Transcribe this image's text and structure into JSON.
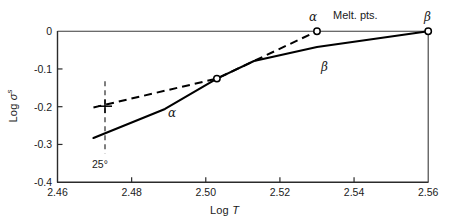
{
  "chart_data": {
    "type": "line",
    "title": "",
    "xlabel": "Log T",
    "ylabel": "Log σˢ",
    "xlim": [
      2.46,
      2.56
    ],
    "ylim": [
      -0.4,
      0.0
    ],
    "xticks": [
      "2.46",
      "2.48",
      "2.50",
      "2.52",
      "2.54",
      "2.56"
    ],
    "xtick_values": [
      2.46,
      2.48,
      2.5,
      2.52,
      2.54,
      2.56
    ],
    "yticks": [
      "0",
      "-0.1",
      "-0.2",
      "-0.3",
      "-0.4"
    ],
    "ytick_values": [
      0.0,
      -0.1,
      -0.2,
      -0.3,
      -0.4
    ],
    "grid": false,
    "legend": "none",
    "series": [
      {
        "name": "α",
        "style": "solid",
        "color": "#000000",
        "points": [
          {
            "x": 2.4697,
            "y": -0.283
          },
          {
            "x": 2.489,
            "y": -0.206
          },
          {
            "x": 2.503,
            "y": -0.1255
          },
          {
            "x": 2.513,
            "y": -0.079
          },
          {
            "x": 2.53,
            "y": -0.042
          },
          {
            "x": 2.56,
            "y": 0.0
          }
        ]
      },
      {
        "name": "β",
        "style": "dashed",
        "color": "#000000",
        "points": [
          {
            "x": 2.4697,
            "y": -0.202
          },
          {
            "x": 2.503,
            "y": -0.1255
          },
          {
            "x": 2.53,
            "y": 0.0
          }
        ]
      }
    ],
    "markers": [
      {
        "label": "α melting point",
        "x": 2.53,
        "y": 0.0,
        "shape": "open-circle"
      },
      {
        "label": "β melting point",
        "x": 2.56,
        "y": 0.0,
        "shape": "open-circle"
      },
      {
        "label": "intersection",
        "x": 2.503,
        "y": -0.1255,
        "shape": "open-circle"
      },
      {
        "label": "25 degree point",
        "x": 2.4747,
        "y": -0.1985,
        "shape": "plus"
      }
    ],
    "reference_lines": [
      {
        "label": "25°",
        "orientation": "vertical",
        "x": 2.4747,
        "style": "dashed",
        "y_from": -0.133,
        "y_to": -0.324
      },
      {
        "label": "β drop",
        "orientation": "vertical",
        "x": 2.56,
        "style": "solid",
        "y_from": 0.0,
        "y_to": -0.4
      }
    ],
    "annotations": [
      {
        "text": "Melt. pts.",
        "x": 2.5425,
        "y": 0.024
      },
      {
        "text": "α",
        "x": 2.5305,
        "y": 0.0255
      },
      {
        "text": "β",
        "x": 2.5605,
        "y": 0.0255
      },
      {
        "text": "α",
        "x": 2.491,
        "y": -0.2175
      },
      {
        "text": "β",
        "x": 2.532,
        "y": -0.0955
      },
      {
        "text": "25°",
        "x": 2.475,
        "y": -0.363
      }
    ]
  },
  "axis": {
    "x_title_prefix": "Log ",
    "x_title_var": "T",
    "y_title_prefix": "Log ",
    "y_title_var": "σ",
    "y_title_sup": "s"
  },
  "ticks": {
    "x": [
      {
        "label": "2.46",
        "value": 2.46
      },
      {
        "label": "2.48",
        "value": 2.48
      },
      {
        "label": "2.50",
        "value": 2.5
      },
      {
        "label": "2.52",
        "value": 2.52
      },
      {
        "label": "2.54",
        "value": 2.54
      },
      {
        "label": "2.56",
        "value": 2.56
      }
    ],
    "y": [
      {
        "label": "0",
        "value": 0.0
      },
      {
        "label": "-0.1",
        "value": -0.1
      },
      {
        "label": "-0.2",
        "value": -0.2
      },
      {
        "label": "-0.3",
        "value": -0.3
      },
      {
        "label": "-0.4",
        "value": -0.4
      }
    ]
  },
  "labels": {
    "melt_pts": "Melt. pts.",
    "alpha_top": "α",
    "beta_top": "β",
    "alpha_curve": "α",
    "beta_curve": "β",
    "temp_25": "25°"
  },
  "colors": {
    "line": "#000000",
    "axis": "#2b2b2b",
    "text": "#1a1a1a",
    "background": "#ffffff"
  }
}
